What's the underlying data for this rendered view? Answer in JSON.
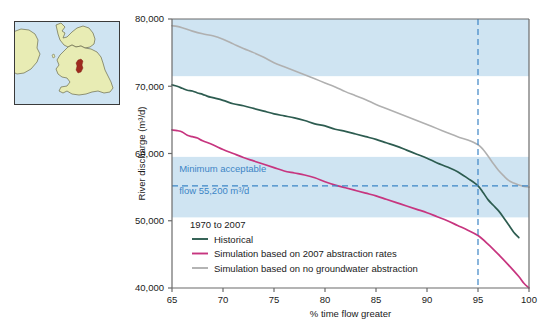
{
  "figure": {
    "map_inset": {
      "name": "uk-location-map",
      "land_color": "#e8ecb4",
      "sea_color": "#cfe4f2",
      "catchment_color": "#9e2a1e",
      "border_color": "#3a3a3a",
      "outline_color": "#6b6b4a"
    },
    "colors": {
      "historical": "#2d5c50",
      "simulation_2007": "#c7357f",
      "simulation_no_abstraction": "#b0b0b0",
      "band": "#cfe4f2",
      "annotation": "#3d85c6",
      "axis": "#6b6b6b",
      "text": "#1a1a1a"
    }
  },
  "chart_data": {
    "type": "line",
    "title": "",
    "xlabel": "% time flow greater",
    "ylabel": "River discharge (m³/d)",
    "xlim": [
      65,
      100
    ],
    "ylim": [
      40000,
      80000
    ],
    "xticks": [
      65,
      70,
      75,
      80,
      85,
      90,
      95,
      100
    ],
    "xtick_labels": [
      "65",
      "70",
      "75",
      "80",
      "85",
      "90",
      "95",
      "100"
    ],
    "yticks": [
      40000,
      50000,
      60000,
      70000,
      80000
    ],
    "ytick_labels": [
      "40,000",
      "50,000",
      "60,000",
      "70,000",
      "80,000"
    ],
    "grid": false,
    "legend_position": "lower-left",
    "legend_title": "1970 to 2007",
    "bands": [
      {
        "name": "upper-blue-band",
        "y0": 71500,
        "y1": 80000,
        "color": "#cfe4f2"
      },
      {
        "name": "lower-blue-band",
        "y0": 50500,
        "y1": 59500,
        "color": "#cfe4f2"
      }
    ],
    "reference_lines": [
      {
        "name": "minimum-acceptable-flow",
        "orientation": "horizontal",
        "value": 55200,
        "style": "dashed",
        "color": "#3d85c6"
      },
      {
        "name": "q95-line",
        "orientation": "vertical",
        "value": 95,
        "style": "dashed",
        "color": "#3d85c6"
      }
    ],
    "annotations": [
      {
        "name": "min-flow-label-line1",
        "text": "Minimum acceptable",
        "x": 65.7,
        "y": 57200
      },
      {
        "name": "min-flow-label-line2",
        "text": "flow 55,200 m³/d",
        "x": 65.7,
        "y": 54000
      }
    ],
    "series": [
      {
        "name": "Historical",
        "color": "#2d5c50",
        "x": [
          65,
          65.5,
          66,
          66.5,
          67,
          67.5,
          68,
          68.5,
          69,
          70,
          71,
          72,
          73,
          74,
          75,
          76,
          77,
          78,
          79,
          80,
          81,
          82,
          83,
          84,
          85,
          86,
          87,
          88,
          89,
          90,
          91,
          92,
          93,
          94,
          95,
          95.5,
          96,
          96.5,
          97,
          97.5,
          98,
          98.5,
          99
        ],
        "values": [
          70200,
          70000,
          69700,
          69400,
          69300,
          69000,
          68800,
          68500,
          68300,
          67900,
          67400,
          67100,
          66700,
          66300,
          65900,
          65600,
          65300,
          64900,
          64400,
          64100,
          63600,
          63300,
          62900,
          62500,
          62100,
          61600,
          61100,
          60500,
          59900,
          59300,
          58600,
          58000,
          57300,
          56300,
          55200,
          54200,
          53100,
          52300,
          51500,
          50500,
          49400,
          48300,
          47500
        ]
      },
      {
        "name": "Simulation based on 2007 abstraction rates",
        "color": "#c7357f",
        "x": [
          65,
          65.5,
          66,
          66.5,
          67,
          67.5,
          68,
          69,
          70,
          71,
          72,
          73,
          74,
          75,
          76,
          77,
          78,
          79,
          80,
          81,
          82,
          83,
          84,
          85,
          86,
          87,
          88,
          89,
          90,
          91,
          92,
          93,
          94,
          95,
          96,
          97,
          98,
          99,
          99.5,
          100
        ],
        "values": [
          63500,
          63400,
          63200,
          62700,
          62500,
          62300,
          61900,
          61300,
          60600,
          60000,
          59400,
          58900,
          58400,
          57900,
          57400,
          57100,
          56800,
          56400,
          55800,
          55300,
          54900,
          54500,
          54100,
          53700,
          53200,
          52700,
          52200,
          51700,
          51200,
          50600,
          50000,
          49300,
          48600,
          47800,
          46500,
          45000,
          43400,
          41700,
          40700,
          40000
        ]
      },
      {
        "name": "Simulation based on no groundwater abstraction",
        "color": "#b0b0b0",
        "x": [
          65,
          65.5,
          66,
          67,
          68,
          69,
          70,
          71,
          72,
          73,
          74,
          75,
          76,
          77,
          78,
          79,
          80,
          81,
          82,
          83,
          84,
          85,
          86,
          87,
          88,
          89,
          90,
          91,
          92,
          93,
          94,
          95,
          95.5,
          96,
          96.5,
          97,
          97.5,
          98,
          98.5,
          99,
          99.5,
          100
        ],
        "values": [
          79000,
          78900,
          78700,
          78200,
          77800,
          77500,
          77000,
          76300,
          75600,
          75000,
          74300,
          73500,
          72900,
          72300,
          71700,
          71100,
          70500,
          69900,
          69200,
          68600,
          68000,
          67300,
          66700,
          66100,
          65500,
          64900,
          64300,
          63700,
          63100,
          62500,
          62000,
          61300,
          60600,
          59600,
          58500,
          57500,
          56700,
          56000,
          55600,
          55300,
          55100,
          55000
        ]
      }
    ],
    "legend_items": [
      {
        "label": "Historical",
        "color": "#2d5c50"
      },
      {
        "label": "Simulation based on 2007 abstraction rates",
        "color": "#c7357f"
      },
      {
        "label": "Simulation based on no groundwater abstraction",
        "color": "#b0b0b0"
      }
    ]
  }
}
